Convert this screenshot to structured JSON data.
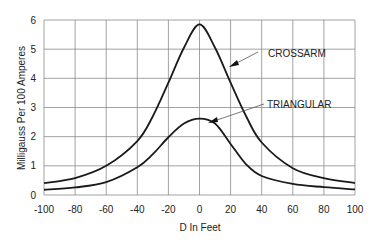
{
  "chart_data": {
    "type": "line",
    "title": "",
    "xlabel": "D In Feet",
    "ylabel": "Milligauss Per 100 Amperes",
    "xlim": [
      -100,
      100
    ],
    "ylim": [
      0,
      6
    ],
    "grid": true,
    "legend": "none (inline annotations with arrows)",
    "x_ticks": [
      -100,
      -80,
      -60,
      -40,
      -20,
      0,
      20,
      40,
      60,
      80,
      100
    ],
    "y_ticks": [
      0,
      1,
      2,
      3,
      4,
      5,
      6
    ],
    "x": [
      -100,
      -80,
      -60,
      -40,
      -30,
      -20,
      -10,
      0,
      10,
      20,
      30,
      40,
      60,
      80,
      100
    ],
    "series": [
      {
        "name": "CROSSARM",
        "values": [
          0.41,
          0.58,
          1.0,
          1.85,
          2.7,
          3.85,
          5.05,
          5.85,
          5.05,
          3.85,
          2.7,
          1.8,
          0.92,
          0.58,
          0.41
        ]
      },
      {
        "name": "TRIANGULAR",
        "values": [
          0.18,
          0.26,
          0.44,
          0.95,
          1.4,
          1.98,
          2.45,
          2.62,
          2.45,
          1.75,
          1.05,
          0.65,
          0.38,
          0.27,
          0.19
        ]
      }
    ],
    "annotations": [
      {
        "text": "CROSSARM",
        "points_to_series": "CROSSARM"
      },
      {
        "text": "TRIANGULAR",
        "points_to_series": "TRIANGULAR"
      }
    ]
  }
}
